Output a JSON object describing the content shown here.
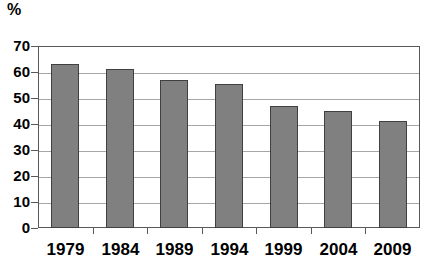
{
  "chart_data": {
    "type": "bar",
    "title": "",
    "subtitle": "",
    "unit_label": "%",
    "xlabel": "",
    "ylabel": "%",
    "categories": [
      "1979",
      "1984",
      "1989",
      "1994",
      "1999",
      "2004",
      "2009"
    ],
    "values": [
      63,
      61,
      57,
      55.5,
      47,
      45,
      41
    ],
    "series": [
      {
        "name": "",
        "values": [
          63,
          61,
          57,
          55.5,
          47,
          45,
          41
        ]
      }
    ],
    "ylim": [
      0,
      70
    ],
    "ytick_step": 10,
    "ytick_labels": [
      "70",
      "60",
      "50",
      "40",
      "30",
      "20",
      "10",
      "0"
    ],
    "ytick_values": [
      70,
      60,
      50,
      40,
      30,
      20,
      10,
      0
    ],
    "grid": true,
    "grid_orientation": "horizontal",
    "legend": false,
    "legend_position": "none",
    "bar_color": "#808080",
    "bar_border_color": "#404040",
    "grid_color": "#a6a6a6",
    "frame_color": "#595959",
    "text_color": "#000000",
    "background_color": "#ffffff",
    "annotations": []
  }
}
